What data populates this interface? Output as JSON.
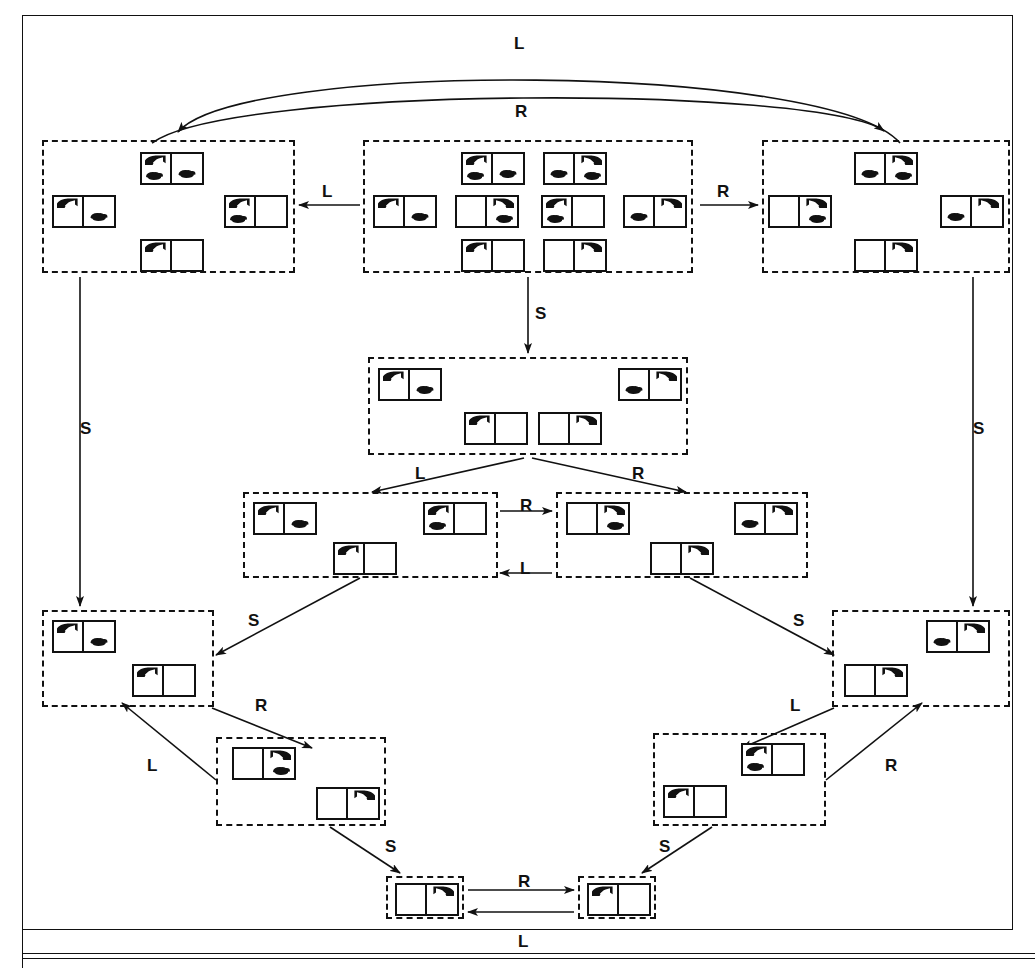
{
  "diagram": {
    "type": "state-transition-graph",
    "actions": [
      "L",
      "R",
      "S"
    ],
    "icons": {
      "vacuum": "vacuum-cleaner-icon",
      "dirt": "dirt-blob-icon",
      "room_box": "two-room-world-icon"
    },
    "belief_states": [
      {
        "id": "b-left-top",
        "name": "belief-left-top",
        "box": {
          "x": 42,
          "y": 140,
          "w": 253,
          "h": 133
        },
        "states": [
          {
            "name": "state-vac-left-dirt-both",
            "x": 96,
            "y": 10,
            "vac": "left",
            "dirt": [
              "left",
              "right"
            ]
          },
          {
            "name": "state-vac-left-dirt-right",
            "x": 8,
            "y": 53,
            "vac": "left",
            "dirt": [
              "right"
            ]
          },
          {
            "name": "state-vac-left-dirt-left",
            "x": 180,
            "y": 53,
            "vac": "left",
            "dirt": [
              "left"
            ]
          },
          {
            "name": "state-vac-left-clean",
            "x": 96,
            "y": 97,
            "vac": "left",
            "dirt": []
          }
        ]
      },
      {
        "id": "b-center-top",
        "name": "belief-center-top-all-eight",
        "box": {
          "x": 363,
          "y": 140,
          "w": 330,
          "h": 133
        },
        "states": [
          {
            "name": "state-vac-left-dirt-both",
            "x": 96,
            "y": 10,
            "vac": "left",
            "dirt": [
              "left",
              "right"
            ]
          },
          {
            "name": "state-vac-right-dirt-both",
            "x": 178,
            "y": 10,
            "vac": "right",
            "dirt": [
              "left",
              "right"
            ]
          },
          {
            "name": "state-vac-left-dirt-right",
            "x": 8,
            "y": 53,
            "vac": "left",
            "dirt": [
              "right"
            ]
          },
          {
            "name": "state-vac-right-dirt-right",
            "x": 90,
            "y": 53,
            "vac": "right",
            "dirt": [
              "right"
            ]
          },
          {
            "name": "state-vac-left-dirt-left",
            "x": 176,
            "y": 53,
            "vac": "left",
            "dirt": [
              "left"
            ]
          },
          {
            "name": "state-vac-right-dirt-left",
            "x": 258,
            "y": 53,
            "vac": "right",
            "dirt": [
              "left"
            ]
          },
          {
            "name": "state-vac-left-clean",
            "x": 96,
            "y": 97,
            "vac": "left",
            "dirt": []
          },
          {
            "name": "state-vac-right-clean",
            "x": 178,
            "y": 97,
            "vac": "right",
            "dirt": []
          }
        ]
      },
      {
        "id": "b-right-top",
        "name": "belief-right-top",
        "box": {
          "x": 762,
          "y": 140,
          "w": 248,
          "h": 133
        },
        "states": [
          {
            "name": "state-vac-right-dirt-both",
            "x": 90,
            "y": 10,
            "vac": "right",
            "dirt": [
              "left",
              "right"
            ]
          },
          {
            "name": "state-vac-right-dirt-right",
            "x": 4,
            "y": 53,
            "vac": "right",
            "dirt": [
              "right"
            ]
          },
          {
            "name": "state-vac-right-dirt-left",
            "x": 176,
            "y": 53,
            "vac": "right",
            "dirt": [
              "left"
            ]
          },
          {
            "name": "state-vac-right-clean",
            "x": 90,
            "y": 97,
            "vac": "right",
            "dirt": []
          }
        ]
      },
      {
        "id": "b-center-s",
        "name": "belief-center-after-suck",
        "box": {
          "x": 368,
          "y": 357,
          "w": 320,
          "h": 98
        },
        "states": [
          {
            "name": "state-vac-left-dirt-right",
            "x": 8,
            "y": 9,
            "vac": "left",
            "dirt": [
              "right"
            ]
          },
          {
            "name": "state-vac-right-dirt-left",
            "x": 248,
            "y": 9,
            "vac": "right",
            "dirt": [
              "left"
            ]
          },
          {
            "name": "state-vac-left-clean",
            "x": 94,
            "y": 53,
            "vac": "left",
            "dirt": []
          },
          {
            "name": "state-vac-right-clean",
            "x": 168,
            "y": 53,
            "vac": "right",
            "dirt": []
          }
        ]
      },
      {
        "id": "b-mid-left",
        "name": "belief-mid-left",
        "box": {
          "x": 243,
          "y": 492,
          "w": 255,
          "h": 86
        },
        "states": [
          {
            "name": "state-vac-left-dirt-right",
            "x": 8,
            "y": 8,
            "vac": "left",
            "dirt": [
              "right"
            ]
          },
          {
            "name": "state-vac-left-dirt-left",
            "x": 178,
            "y": 8,
            "vac": "left",
            "dirt": [
              "left"
            ]
          },
          {
            "name": "state-vac-left-clean",
            "x": 88,
            "y": 48,
            "vac": "left",
            "dirt": []
          }
        ]
      },
      {
        "id": "b-mid-right",
        "name": "belief-mid-right",
        "box": {
          "x": 556,
          "y": 492,
          "w": 252,
          "h": 86
        },
        "states": [
          {
            "name": "state-vac-right-dirt-right",
            "x": 8,
            "y": 8,
            "vac": "right",
            "dirt": [
              "right"
            ]
          },
          {
            "name": "state-vac-right-dirt-left",
            "x": 176,
            "y": 8,
            "vac": "right",
            "dirt": [
              "left"
            ]
          },
          {
            "name": "state-vac-right-clean",
            "x": 92,
            "y": 48,
            "vac": "right",
            "dirt": []
          }
        ]
      },
      {
        "id": "b-lower-left-a",
        "name": "belief-lower-left-outer",
        "box": {
          "x": 42,
          "y": 610,
          "w": 172,
          "h": 97
        },
        "states": [
          {
            "name": "state-vac-left-dirt-right",
            "x": 8,
            "y": 8,
            "vac": "left",
            "dirt": [
              "right"
            ]
          },
          {
            "name": "state-vac-left-clean",
            "x": 88,
            "y": 52,
            "vac": "left",
            "dirt": []
          }
        ]
      },
      {
        "id": "b-lower-left-b",
        "name": "belief-lower-left-inner",
        "box": {
          "x": 216,
          "y": 737,
          "w": 170,
          "h": 89
        },
        "states": [
          {
            "name": "state-vac-right-dirt-right",
            "x": 14,
            "y": 8,
            "vac": "right",
            "dirt": [
              "right"
            ]
          },
          {
            "name": "state-vac-right-clean",
            "x": 98,
            "y": 48,
            "vac": "right",
            "dirt": []
          }
        ]
      },
      {
        "id": "b-lower-right-a",
        "name": "belief-lower-right-outer",
        "box": {
          "x": 832,
          "y": 610,
          "w": 178,
          "h": 97
        },
        "states": [
          {
            "name": "state-vac-right-dirt-left",
            "x": 92,
            "y": 8,
            "vac": "right",
            "dirt": [
              "left"
            ]
          },
          {
            "name": "state-vac-right-clean",
            "x": 10,
            "y": 52,
            "vac": "right",
            "dirt": []
          }
        ]
      },
      {
        "id": "b-lower-right-b",
        "name": "belief-lower-right-inner",
        "box": {
          "x": 653,
          "y": 733,
          "w": 173,
          "h": 93
        },
        "states": [
          {
            "name": "state-vac-left-dirt-left",
            "x": 86,
            "y": 8,
            "vac": "left",
            "dirt": [
              "left"
            ]
          },
          {
            "name": "state-vac-left-clean",
            "x": 8,
            "y": 50,
            "vac": "left",
            "dirt": []
          }
        ]
      },
      {
        "id": "b-bottom-left",
        "name": "belief-bottom-left-goal",
        "box": {
          "x": 386,
          "y": 876,
          "w": 78,
          "h": 43
        },
        "states": [
          {
            "name": "state-vac-right-clean",
            "x": 7,
            "y": 5,
            "vac": "right",
            "dirt": []
          }
        ]
      },
      {
        "id": "b-bottom-right",
        "name": "belief-bottom-right-goal",
        "box": {
          "x": 578,
          "y": 876,
          "w": 78,
          "h": 43
        },
        "states": [
          {
            "name": "state-vac-left-clean",
            "x": 7,
            "y": 5,
            "vac": "left",
            "dirt": []
          }
        ]
      }
    ],
    "edge_labels": [
      {
        "name": "edge-label-top-arc-L",
        "text": "L",
        "x": 514,
        "y": 35
      },
      {
        "name": "edge-label-top-arc-R",
        "text": "R",
        "x": 515,
        "y": 103
      },
      {
        "name": "edge-label-center-to-left-L",
        "text": "L",
        "x": 322,
        "y": 183
      },
      {
        "name": "edge-label-center-to-right-R",
        "text": "R",
        "x": 717,
        "y": 183
      },
      {
        "name": "edge-label-center-suck-S",
        "text": "S",
        "x": 535,
        "y": 305
      },
      {
        "name": "edge-label-left-down-S",
        "text": "S",
        "x": 80,
        "y": 420
      },
      {
        "name": "edge-label-right-down-S",
        "text": "S",
        "x": 973,
        "y": 420
      },
      {
        "name": "edge-label-suck-split-L",
        "text": "L",
        "x": 415,
        "y": 465
      },
      {
        "name": "edge-label-suck-split-R",
        "text": "R",
        "x": 632,
        "y": 465
      },
      {
        "name": "edge-label-mid-R",
        "text": "R",
        "x": 520,
        "y": 497
      },
      {
        "name": "edge-label-mid-L",
        "text": "L",
        "x": 520,
        "y": 560
      },
      {
        "name": "edge-label-midleft-down-S",
        "text": "S",
        "x": 248,
        "y": 612
      },
      {
        "name": "edge-label-midright-down-S",
        "text": "S",
        "x": 793,
        "y": 612
      },
      {
        "name": "edge-label-lowleft-R",
        "text": "R",
        "x": 255,
        "y": 697
      },
      {
        "name": "edge-label-lowleft-L",
        "text": "L",
        "x": 147,
        "y": 757
      },
      {
        "name": "edge-label-lowright-L",
        "text": "L",
        "x": 790,
        "y": 697
      },
      {
        "name": "edge-label-lowright-R",
        "text": "R",
        "x": 885,
        "y": 757
      },
      {
        "name": "edge-label-bottomleft-S",
        "text": "S",
        "x": 385,
        "y": 838
      },
      {
        "name": "edge-label-bottomright-S",
        "text": "S",
        "x": 659,
        "y": 838
      },
      {
        "name": "edge-label-bottom-R",
        "text": "R",
        "x": 518,
        "y": 873
      },
      {
        "name": "edge-label-bottom-L",
        "text": "L",
        "x": 518,
        "y": 933
      }
    ]
  }
}
